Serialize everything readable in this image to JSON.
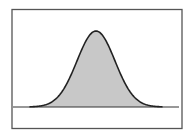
{
  "chart_data": {
    "type": "area",
    "title": "",
    "xlabel": "",
    "ylabel": "",
    "distribution": {
      "mean": 0,
      "std": 1
    },
    "x_range": [
      -3.5,
      3.5
    ],
    "grid": false,
    "legend": null,
    "series": [
      {
        "name": "density",
        "fill": "#c8c8c8",
        "stroke": "#222222"
      }
    ]
  },
  "colors": {
    "frame": "#555555",
    "fill": "#c8c8c8",
    "stroke": "#222222",
    "baseline": "#333333"
  }
}
